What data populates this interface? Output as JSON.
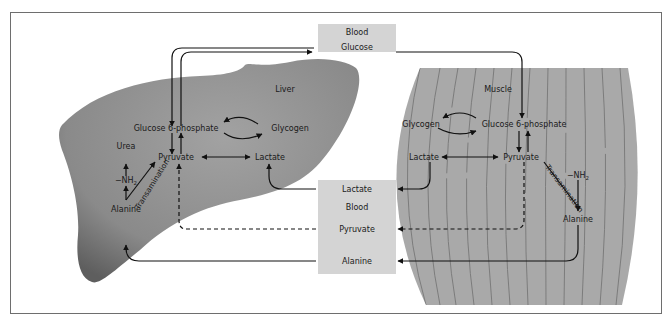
{
  "figure": {
    "colors": {
      "frame": "#6e6e6e",
      "blood_box": "#d4d4d4",
      "liver_fill_dark": "#6f6f6f",
      "liver_fill_light": "#9a9a9a",
      "muscle_fill": "#a9a9a9",
      "muscle_striation": "#7f7f7f",
      "arrow": "#111111"
    }
  },
  "blood_top": {
    "title": "Blood",
    "item": "Glucose"
  },
  "blood_bottom": {
    "title": "Blood",
    "items": [
      "Lactate",
      "Pyruvate",
      "Alanine"
    ]
  },
  "liver": {
    "organ_label": "Liver",
    "glucose6p": "Glucose 6-phosphate",
    "glycogen": "Glycogen",
    "pyruvate": "Pyruvate",
    "lactate": "Lactate",
    "urea": "Urea",
    "nh2": "−NH",
    "nh2_sub": "2",
    "transamination": "Transamination",
    "alanine": "Alanine"
  },
  "muscle": {
    "organ_label": "Muscle",
    "glucose6p": "Glucose 6-phosphate",
    "glycogen": "Glycogen",
    "pyruvate": "Pyruvate",
    "lactate": "Lactate",
    "nh2": "−NH",
    "nh2_sub": "2",
    "transamination": "Transamination",
    "alanine": "Alanine"
  }
}
